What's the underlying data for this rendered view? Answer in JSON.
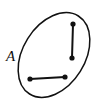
{
  "figure": {
    "type": "geometry-diagram",
    "background_color": "#ffffff",
    "stroke_color": "#111111",
    "canvas": {
      "width": 104,
      "height": 110
    },
    "region": {
      "shape": "ellipse",
      "label": "A",
      "label_position": {
        "x": 6,
        "y": 61
      },
      "center": {
        "x": 54,
        "y": 55
      },
      "radius_major": 46,
      "radius_minor": 31,
      "rotation_degrees": -58,
      "stroke_width": 1.5,
      "fill": "none"
    },
    "segments": [
      {
        "name": "vertical-segment",
        "x1": 73,
        "y1": 24,
        "x2": 72,
        "y2": 58,
        "stroke_width": 2,
        "endpoint_radius": 2.6
      },
      {
        "name": "horizontal-segment",
        "x1": 30,
        "y1": 79,
        "x2": 65,
        "y2": 77,
        "stroke_width": 2,
        "endpoint_radius": 2.6
      }
    ]
  }
}
